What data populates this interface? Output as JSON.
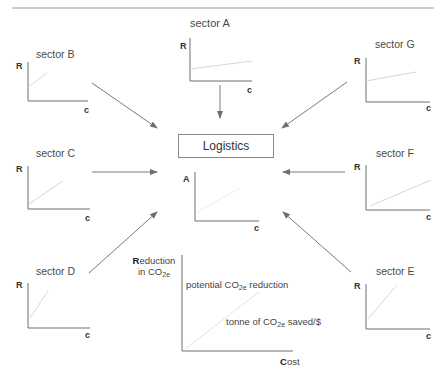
{
  "diagram": {
    "center_node": {
      "label": "Logistics"
    },
    "center_chart": {
      "y_axis": "A",
      "x_axis": "c"
    },
    "sectors": [
      {
        "id": "A",
        "label": "sector A",
        "y_axis": "R",
        "x_axis": "c"
      },
      {
        "id": "B",
        "label": "sector B",
        "y_axis": "R",
        "x_axis": "c"
      },
      {
        "id": "G",
        "label": "sector G",
        "y_axis": "R",
        "x_axis": "c"
      },
      {
        "id": "C",
        "label": "sector C",
        "y_axis": "R",
        "x_axis": "c"
      },
      {
        "id": "F",
        "label": "sector F",
        "y_axis": "R",
        "x_axis": "c"
      },
      {
        "id": "D",
        "label": "sector D",
        "y_axis": "R",
        "x_axis": "c"
      },
      {
        "id": "E",
        "label": "sector E",
        "y_axis": "R",
        "x_axis": "c"
      }
    ],
    "legend_chart": {
      "y_axis_initial": "R",
      "y_axis_rest": "eduction",
      "y_axis_line2_prefix": "in CO",
      "y_axis_line2_sub": "2e",
      "x_axis_initial": "C",
      "x_axis_rest": "ost",
      "annotation_top_prefix": "potential CO",
      "annotation_top_sub": "2e",
      "annotation_top_suffix": " reduction",
      "annotation_slope_prefix": "tonne of CO",
      "annotation_slope_sub": "2e",
      "annotation_slope_suffix": " saved/$"
    },
    "colors": {
      "axis": "#6e6e6e",
      "arrow": "#7a7a7a",
      "trend_line": "#d6d6d6",
      "rule": "#9a9a9a"
    }
  }
}
